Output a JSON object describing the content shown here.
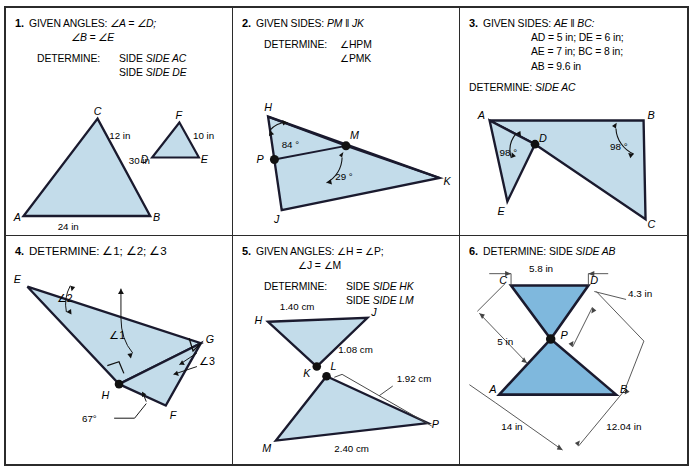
{
  "worksheet": {
    "title": "Similar Triangles Problem Set",
    "fill_light": "#c3dcea",
    "fill_mid": "#7fb8dd",
    "stroke": "#1a1a2e",
    "border": "#2b2b2b"
  },
  "panels": [
    {
      "number": "1.",
      "given_label": "GIVEN ANGLES:",
      "given_lines": [
        "∠A = ∠D;",
        "∠B = ∠E"
      ],
      "determine_label": "DETERMINE:",
      "determine_lines": [
        "SIDE AC",
        "SIDE DE"
      ],
      "figure": {
        "vertices": [
          "A",
          "B",
          "C",
          "D",
          "E",
          "F"
        ],
        "dimensions": [
          "24 in",
          "30 in",
          "12 in",
          "10 in"
        ]
      }
    },
    {
      "number": "2.",
      "given_label": "GIVEN SIDES:",
      "given_lines": [
        "PM ‖ JK"
      ],
      "determine_label": "DETERMINE:",
      "determine_lines": [
        "∠HPM",
        "∠PMK"
      ],
      "figure": {
        "vertices": [
          "H",
          "P",
          "J",
          "M",
          "K"
        ],
        "angles": [
          "84°",
          "29°"
        ]
      }
    },
    {
      "number": "3.",
      "given_label": "GIVEN SIDES:",
      "given_lines": [
        "AE ‖ BC:",
        "AD = 5 in; DE = 6 in;",
        "AE = 7 in; BC = 8 in;",
        "AB = 9.6 in"
      ],
      "determine_label": "DETERMINE:",
      "determine_lines": [
        "SIDE AC"
      ],
      "figure": {
        "vertices": [
          "A",
          "B",
          "D",
          "E",
          "C"
        ],
        "angles": [
          "98°",
          "98°"
        ]
      }
    },
    {
      "number": "4.",
      "given_label": "DETERMINE:",
      "given_lines": [
        "∠1; ∠2; ∠3"
      ],
      "determine_label": "",
      "determine_lines": [],
      "figure": {
        "vertices": [
          "E",
          "G",
          "H",
          "F"
        ],
        "angles": [
          "∠1",
          "∠2",
          "∠3",
          "67°"
        ]
      }
    },
    {
      "number": "5.",
      "given_label": "GIVEN ANGLES:",
      "given_lines": [
        "∠H = ∠P;",
        "∠J = ∠M"
      ],
      "determine_label": "DETERMINE:",
      "determine_lines": [
        "SIDE HK",
        "SIDE LM"
      ],
      "figure": {
        "vertices": [
          "H",
          "J",
          "K",
          "L",
          "M",
          "P"
        ],
        "dimensions": [
          "1.40 cm",
          "1.08 cm",
          "1.92 cm",
          "2.40 cm"
        ]
      }
    },
    {
      "number": "6.",
      "given_label": "DETERMINE:",
      "given_lines": [
        "SIDE AB"
      ],
      "determine_label": "",
      "determine_lines": [],
      "figure": {
        "vertices": [
          "C",
          "D",
          "P",
          "A",
          "B"
        ],
        "dimensions": [
          "5.8 in",
          "4.3 in",
          "5 in",
          "14 in",
          "12.04 in"
        ]
      }
    }
  ],
  "p1": {
    "num": "1.",
    "given_label": "GIVEN ANGLES:",
    "g1": "∠A = ∠D;",
    "g2": "∠B = ∠E",
    "det_label": "DETERMINE:",
    "d1": "SIDE AC",
    "d2": "SIDE DE",
    "vA": "A",
    "vB": "B",
    "vC": "C",
    "vD": "D",
    "vE": "E",
    "vF": "F",
    "m24": "24 in",
    "m30": "30 in",
    "m12": "12 in",
    "m10": "10 in"
  },
  "p2": {
    "num": "2.",
    "given_label": "GIVEN SIDES:",
    "g1": "PM ‖ JK",
    "det_label": "DETERMINE:",
    "d1": "∠HPM",
    "d2": "∠PMK",
    "vH": "H",
    "vP": "P",
    "vJ": "J",
    "vM": "M",
    "vK": "K",
    "a84": "84 °",
    "a29": "29 °"
  },
  "p3": {
    "num": "3.",
    "given_label": "GIVEN SIDES:",
    "g1": "AE ‖ BC:",
    "g2": "AD = 5 in; DE = 6 in;",
    "g3": "AE = 7 in; BC = 8 in;",
    "g4": "AB = 9.6 in",
    "det_label": "DETERMINE:",
    "d1": "SIDE AC",
    "vA": "A",
    "vB": "B",
    "vD": "D",
    "vE": "E",
    "vC": "C",
    "a98a": "98 °",
    "a98b": "98 °"
  },
  "p4": {
    "num": "4.",
    "det_label": "DETERMINE:",
    "d1": "∠1; ∠2; ∠3",
    "vE": "E",
    "vG": "G",
    "vH": "H",
    "vF": "F",
    "ang1": "∠1",
    "ang2": "∠2",
    "ang3": "∠3",
    "a67": "67°"
  },
  "p5": {
    "num": "5.",
    "given_label": "GIVEN ANGLES:",
    "g1": "∠H = ∠P;",
    "g2": "∠J = ∠M",
    "det_label": "DETERMINE:",
    "d1": "SIDE HK",
    "d2": "SIDE LM",
    "vH": "H",
    "vJ": "J",
    "vK": "K",
    "vL": "L",
    "vM": "M",
    "vP": "P",
    "m140": "1.40 cm",
    "m108": "1.08 cm",
    "m192": "1.92 cm",
    "m240": "2.40 cm"
  },
  "p6": {
    "num": "6.",
    "det_label": "DETERMINE:",
    "d1": "SIDE AB",
    "vC": "C",
    "vD": "D",
    "vP": "P",
    "vA": "A",
    "vB": "B",
    "m58": "5.8 in",
    "m43": "4.3 in",
    "m5": "5 in",
    "m14": "14 in",
    "m1204": "12.04 in"
  }
}
